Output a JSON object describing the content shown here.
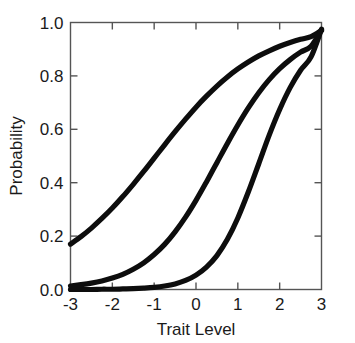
{
  "chart_data": {
    "type": "line",
    "title": "",
    "xlabel": "Trait Level",
    "ylabel": "Probability",
    "xlim": [
      -3,
      3
    ],
    "ylim": [
      0.0,
      1.0
    ],
    "grid": false,
    "legend_position": "none",
    "xticks": [
      -3,
      -2,
      -1,
      0,
      1,
      2,
      3
    ],
    "xtick_labels": [
      "-3",
      "-2",
      "-1",
      "0",
      "1",
      "2",
      "3"
    ],
    "yticks": [
      0.0,
      0.2,
      0.4,
      0.6,
      0.8,
      1.0
    ],
    "ytick_labels": [
      "0.0",
      "0.2",
      "0.4",
      "0.6",
      "0.8",
      "1.0"
    ],
    "line_color": "#0d0d0d",
    "axis_color": "#555555",
    "background_color": "#ffffff",
    "x": [
      -3.0,
      -2.75,
      -2.5,
      -2.25,
      -2.0,
      -1.75,
      -1.5,
      -1.25,
      -1.0,
      -0.75,
      -0.5,
      -0.25,
      0.0,
      0.25,
      0.5,
      0.75,
      1.0,
      1.25,
      1.5,
      1.75,
      2.0,
      2.25,
      2.5,
      2.75,
      3.0
    ],
    "series": [
      {
        "name": "curve-1",
        "values": [
          0.17,
          0.198,
          0.23,
          0.266,
          0.305,
          0.348,
          0.394,
          0.442,
          0.492,
          0.542,
          0.591,
          0.638,
          0.683,
          0.724,
          0.762,
          0.796,
          0.826,
          0.852,
          0.875,
          0.894,
          0.911,
          0.925,
          0.937,
          0.947,
          0.97
        ]
      },
      {
        "name": "curve-2",
        "values": [
          0.013,
          0.018,
          0.024,
          0.032,
          0.043,
          0.057,
          0.076,
          0.1,
          0.131,
          0.169,
          0.216,
          0.271,
          0.334,
          0.403,
          0.475,
          0.547,
          0.616,
          0.68,
          0.737,
          0.786,
          0.827,
          0.861,
          0.889,
          0.911,
          0.972
        ]
      },
      {
        "name": "curve-3",
        "values": [
          0.0,
          0.0,
          0.0,
          0.001,
          0.001,
          0.002,
          0.003,
          0.005,
          0.008,
          0.013,
          0.021,
          0.034,
          0.054,
          0.084,
          0.127,
          0.188,
          0.268,
          0.365,
          0.471,
          0.578,
          0.674,
          0.756,
          0.821,
          0.871,
          0.975
        ]
      }
    ]
  }
}
